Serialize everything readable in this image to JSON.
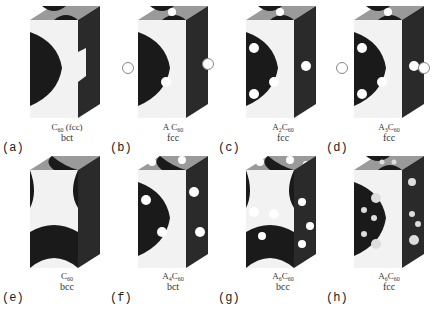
{
  "figure": {
    "colors": {
      "background": "#ffffff",
      "cube_top": "#9a9a9a",
      "cube_front": "#f2f2f2",
      "cube_side": "#2a2a2a",
      "void": "#1a1a1a",
      "dopant": "#ffffff"
    },
    "panels": [
      {
        "id": "a",
        "label": "(a)",
        "formula_prefix": "",
        "formula_sub_a": "",
        "formula_c": "C",
        "formula_c_sub": "60",
        "formula_suffix": " (fcc)",
        "lattice": "bct",
        "dopants": 0
      },
      {
        "id": "b",
        "label": "(b)",
        "formula_prefix": "A ",
        "formula_sub_a": "",
        "formula_c": "C",
        "formula_c_sub": "60",
        "formula_suffix": "",
        "lattice": "fcc",
        "dopants": 1
      },
      {
        "id": "c",
        "label": "(c)",
        "formula_prefix": "A",
        "formula_sub_a": "2",
        "formula_c": "C",
        "formula_c_sub": "60",
        "formula_suffix": "",
        "lattice": "fcc",
        "dopants": 2
      },
      {
        "id": "d",
        "label": "(d)",
        "formula_prefix": "A",
        "formula_sub_a": "3",
        "formula_c": "C",
        "formula_c_sub": "60",
        "formula_suffix": "",
        "lattice": "fcc",
        "dopants": 3
      },
      {
        "id": "e",
        "label": "(e)",
        "formula_prefix": "",
        "formula_sub_a": "",
        "formula_c": "C",
        "formula_c_sub": "60",
        "formula_suffix": "",
        "lattice": "bcc",
        "dopants": 0
      },
      {
        "id": "f",
        "label": "(f)",
        "formula_prefix": "A",
        "formula_sub_a": "4",
        "formula_c": "C",
        "formula_c_sub": "60",
        "formula_suffix": "",
        "lattice": "bct",
        "dopants": 4
      },
      {
        "id": "g",
        "label": "(g)",
        "formula_prefix": "A",
        "formula_sub_a": "6",
        "formula_c": "C",
        "formula_c_sub": "60",
        "formula_suffix": "",
        "lattice": "bcc",
        "dopants": 6
      },
      {
        "id": "h",
        "label": "(h)",
        "formula_prefix": "A",
        "formula_sub_a": "6",
        "formula_c": "C",
        "formula_c_sub": "60",
        "formula_suffix": "",
        "lattice": "fcc",
        "dopants": 6
      }
    ]
  }
}
